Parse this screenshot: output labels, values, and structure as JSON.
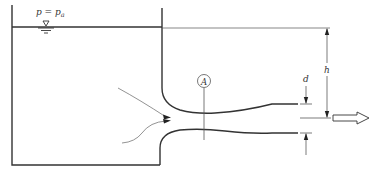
{
  "diagram": {
    "labels": {
      "pressure": "p = p",
      "pressure_sub": "a",
      "section": "A",
      "diameter": "d",
      "head": "h"
    },
    "colors": {
      "stroke": "#333333",
      "streamline": "#777777",
      "background": "#ffffff"
    }
  }
}
